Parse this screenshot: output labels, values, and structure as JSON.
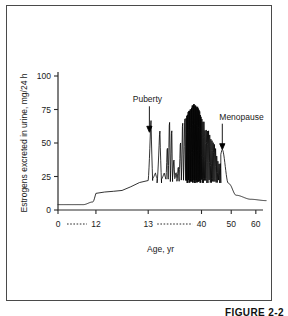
{
  "figure": {
    "caption": "FIGURE 2-2",
    "frame_color": "#4a4a4a",
    "background": "#ffffff",
    "curve_color": "#000000"
  },
  "chart_data": {
    "type": "line",
    "title": "",
    "xlabel": "Age, yr",
    "ylabel": "Estrogens excreted in urine, mg/24 h",
    "grid": false,
    "legend": "none",
    "ylim": [
      0,
      100
    ],
    "yticks": [
      0,
      25,
      50,
      75,
      100
    ],
    "ytick_labels": [
      "0",
      "25",
      "50",
      "75",
      "100"
    ],
    "xlim": [
      0,
      64
    ],
    "xticks": [
      0,
      12,
      13,
      40,
      50,
      60
    ],
    "xtick_labels": [
      "0",
      "12",
      "13",
      "40",
      "50",
      "60"
    ],
    "x_axis_note": "broken / compressed scale: dotted connectors span 0-12 and 13-40",
    "dotted_spans": [
      [
        0,
        12
      ],
      [
        13,
        40
      ]
    ],
    "annotations": [
      {
        "label": "Puberty",
        "x": 13.6,
        "y": 58,
        "arrow": "down"
      },
      {
        "label": "Menopause",
        "x": 47.0,
        "y": 45,
        "arrow": "down"
      }
    ],
    "phases": [
      {
        "name": "childhood baseline",
        "x_start": 0,
        "x_end": 10.5,
        "y_low": 4,
        "y_high": 5,
        "cycles": 0
      },
      {
        "name": "pubertal rise",
        "x_start": 10.5,
        "x_end": 13.0,
        "y_low": 5,
        "y_high": 22,
        "cycles": 0
      },
      {
        "name": "early cycles",
        "x_start": 13.0,
        "x_end": 22.0,
        "y_low": 22,
        "y_high": 72,
        "cycles": 4
      },
      {
        "name": "established cycles",
        "x_start": 22.0,
        "x_end": 32.0,
        "y_low": 23,
        "y_high": 80,
        "cycles": 9
      },
      {
        "name": "peak reproductive",
        "x_start": 32.0,
        "x_end": 41.0,
        "y_low": 22,
        "y_high": 98,
        "cycles": 26
      },
      {
        "name": "perimenopause",
        "x_start": 41.0,
        "x_end": 46.5,
        "y_low": 22,
        "y_high": 72,
        "cycles": 14
      },
      {
        "name": "menopausal decline",
        "x_start": 46.5,
        "x_end": 52.0,
        "y_low": 8,
        "y_high": 45,
        "cycles": 0
      },
      {
        "name": "postmenopause",
        "x_start": 52.0,
        "x_end": 64.0,
        "y_low": 7,
        "y_high": 9,
        "cycles": 0
      }
    ],
    "key_points": [
      {
        "x": 0,
        "y": 4
      },
      {
        "x": 8,
        "y": 4
      },
      {
        "x": 11,
        "y": 6
      },
      {
        "x": 12.4,
        "y": 14
      },
      {
        "x": 13.0,
        "y": 22
      },
      {
        "x": 13.6,
        "y": 58
      },
      {
        "x": 14.2,
        "y": 72
      },
      {
        "x": 16,
        "y": 22
      },
      {
        "x": 18,
        "y": 68
      },
      {
        "x": 21,
        "y": 23
      },
      {
        "x": 24,
        "y": 78
      },
      {
        "x": 27,
        "y": 24
      },
      {
        "x": 31,
        "y": 80
      },
      {
        "x": 34,
        "y": 92
      },
      {
        "x": 36,
        "y": 98
      },
      {
        "x": 38,
        "y": 95
      },
      {
        "x": 41,
        "y": 80
      },
      {
        "x": 44,
        "y": 60
      },
      {
        "x": 46,
        "y": 38
      },
      {
        "x": 47,
        "y": 45
      },
      {
        "x": 49,
        "y": 20
      },
      {
        "x": 52,
        "y": 11
      },
      {
        "x": 58,
        "y": 8
      },
      {
        "x": 64,
        "y": 7
      }
    ]
  }
}
